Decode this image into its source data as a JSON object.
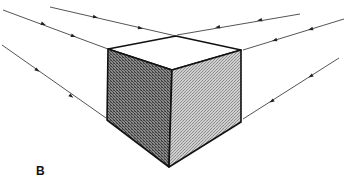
{
  "figure": {
    "label": "B",
    "colors": {
      "background": "#ffffff",
      "edge": "#111111",
      "guide_line": "#555555",
      "left_face": "#6e6e6e",
      "right_face": "#b4b4b4",
      "top_face": "#ffffff"
    },
    "cube": {
      "top_back": [
        176,
        36
      ],
      "left_top": [
        108,
        49
      ],
      "right_top": [
        241,
        50
      ],
      "front_top": [
        172,
        70
      ],
      "left_bottom": [
        107,
        120
      ],
      "right_bottom": [
        241,
        122
      ],
      "front_bottom": [
        169,
        167
      ]
    },
    "guide_lines": [
      {
        "from": [
          50,
          7
        ],
        "to": [
          176,
          36
        ],
        "arrows": [
          [
            95,
            17
          ],
          [
            140,
            28
          ]
        ]
      },
      {
        "from": [
          3,
          10
        ],
        "to": [
          108,
          49
        ],
        "arrows": [
          [
            43,
            24
          ],
          [
            73,
            36
          ]
        ]
      },
      {
        "from": [
          2,
          45
        ],
        "to": [
          106,
          118
        ],
        "arrows": [
          [
            37,
            70
          ],
          [
            71,
            96
          ]
        ]
      },
      {
        "from": [
          300,
          14
        ],
        "to": [
          177,
          35
        ],
        "arrows": [
          [
            260,
            20
          ],
          [
            218,
            27
          ]
        ]
      },
      {
        "from": [
          344,
          19
        ],
        "to": [
          243,
          50
        ],
        "arrows": [
          [
            311,
            29
          ],
          [
            275,
            40
          ]
        ]
      },
      {
        "from": [
          339,
          58
        ],
        "to": [
          243,
          119
        ],
        "arrows": [
          [
            311,
            76
          ],
          [
            272,
            101
          ]
        ]
      }
    ]
  }
}
